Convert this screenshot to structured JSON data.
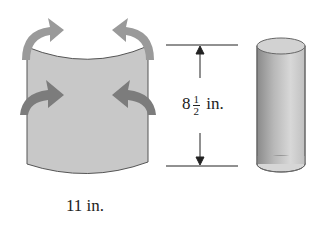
{
  "diagram": {
    "sheet": {
      "width_label": "11 in.",
      "fill_color": "#c8c8c8",
      "arrow_color": "#8f8f8f"
    },
    "height_dimension": {
      "whole": "8",
      "numerator": "1",
      "denominator": "2",
      "unit": "in."
    },
    "cylinder": {
      "fill_color": "#b5b5b5"
    }
  }
}
